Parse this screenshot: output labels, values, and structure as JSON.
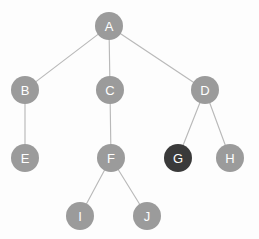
{
  "diagram": {
    "type": "tree-graph",
    "background_color": "#fdfdfd",
    "node_color": "#9b9b9b",
    "node_highlight_color": "#3a3a3a",
    "node_label_color": "#ffffff",
    "edge_color": "#b9b9b9",
    "node_radius": 14,
    "nodes": [
      {
        "id": "A",
        "label": "A",
        "x": 109,
        "y": 26,
        "highlighted": false,
        "depth": 0
      },
      {
        "id": "B",
        "label": "B",
        "x": 25,
        "y": 90,
        "highlighted": false,
        "depth": 1
      },
      {
        "id": "C",
        "label": "C",
        "x": 110,
        "y": 90,
        "highlighted": false,
        "depth": 1
      },
      {
        "id": "D",
        "label": "D",
        "x": 205,
        "y": 90,
        "highlighted": false,
        "depth": 1
      },
      {
        "id": "E",
        "label": "E",
        "x": 25,
        "y": 158,
        "highlighted": false,
        "depth": 2
      },
      {
        "id": "F",
        "label": "F",
        "x": 111,
        "y": 158,
        "highlighted": false,
        "depth": 2
      },
      {
        "id": "G",
        "label": "G",
        "x": 178,
        "y": 158,
        "highlighted": true,
        "depth": 2
      },
      {
        "id": "H",
        "label": "H",
        "x": 230,
        "y": 158,
        "highlighted": false,
        "depth": 2
      },
      {
        "id": "I",
        "label": "I",
        "x": 80,
        "y": 216,
        "highlighted": false,
        "depth": 3
      },
      {
        "id": "J",
        "label": "J",
        "x": 147,
        "y": 216,
        "highlighted": false,
        "depth": 3
      }
    ],
    "edges": [
      {
        "from": "A",
        "to": "B"
      },
      {
        "from": "A",
        "to": "C"
      },
      {
        "from": "A",
        "to": "D"
      },
      {
        "from": "B",
        "to": "E"
      },
      {
        "from": "C",
        "to": "F"
      },
      {
        "from": "D",
        "to": "G"
      },
      {
        "from": "D",
        "to": "H"
      },
      {
        "from": "F",
        "to": "I"
      },
      {
        "from": "F",
        "to": "J"
      }
    ]
  }
}
